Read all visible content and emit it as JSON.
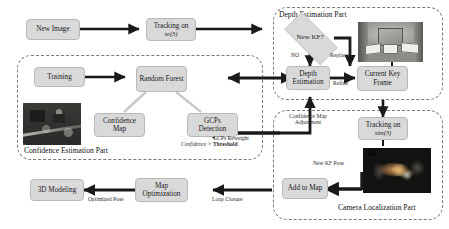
{
  "diagram": {
    "groups": [
      {
        "id": "depth",
        "label": "Depth Estimation Part"
      },
      {
        "id": "confidence",
        "label": "Confidence Estimation Part"
      },
      {
        "id": "camera",
        "label": "Camera Localization Part"
      }
    ],
    "nodes": {
      "new_image": {
        "label": "New Image"
      },
      "tracking_se3": {
        "label": "Tracking on",
        "sub": "se(3)"
      },
      "training": {
        "label": "Training"
      },
      "random_forest": {
        "label": "Random Forest"
      },
      "confidence_map": {
        "label": "Confidence Map"
      },
      "gcps_detection": {
        "label": "GCPs Detection"
      },
      "new_kf": {
        "label": "New KF?"
      },
      "depth_estimation": {
        "label": "Depth Estimation"
      },
      "current_key_frame": {
        "label": "Current Key Frame"
      },
      "tracking_sim3": {
        "label": "Tracking on",
        "sub": "sim(3)"
      },
      "add_to_map": {
        "label": "Add to Map"
      },
      "map_optimization": {
        "label": "Map Optimization"
      },
      "modeling_3d": {
        "label": "3D  Modeling"
      }
    },
    "edge_labels": {
      "no": "NO",
      "replace": "Replace",
      "refine": "Refine",
      "confidence_threshold_prefix": "Confidence > ",
      "confidence_threshold_bold": "Threshold",
      "confidence_map_adjustment_l1": "Confidence Map",
      "confidence_map_adjustment_l2": "Adjustment",
      "gcps_reweight": "GCPs Reweight",
      "new_kf_pose": "New KF Pose",
      "optimized_pose": "Optimized Pose",
      "loop_closure": "Loop Closure"
    },
    "thumbnails": {
      "keyframe_room": "room-photo-thumbnail",
      "confidence_img": "cluttered-scene-photo-thumbnail",
      "point_cloud": "point-cloud-map-thumbnail"
    },
    "colors": {
      "box_fill": "#d9d9d9",
      "box_border": "#b8b8b8",
      "group_border": "#7a7a7a",
      "arrow": "#1a1a1a",
      "light_arrow": "#c9c9c9",
      "background": "#ffffff"
    }
  }
}
